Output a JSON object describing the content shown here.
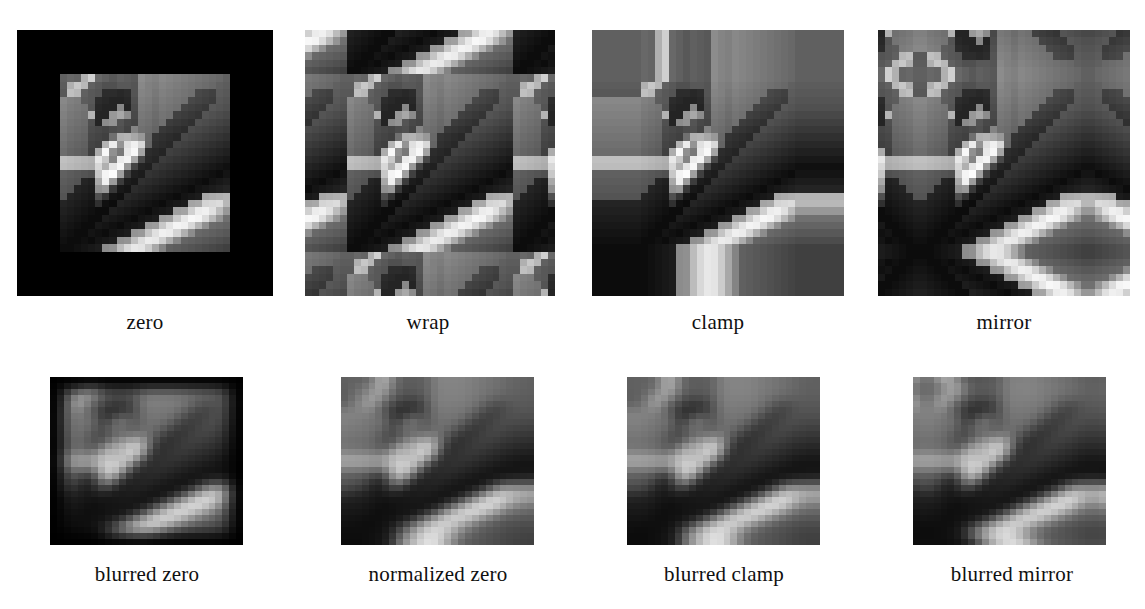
{
  "figure": {
    "name": "image-border-handling-comparison",
    "background_color": "#ffffff",
    "caption_color": "#101010",
    "rows": 2,
    "columns": 4
  },
  "panels": [
    {
      "id": "zero",
      "label": "zero",
      "mode": "zero",
      "blurred": false,
      "x": 17,
      "y": 30,
      "w": 256,
      "h": 266,
      "caption_y": 310,
      "caption_x": 17,
      "caption_w": 256,
      "border_pixels": 6,
      "border_color": "#000000"
    },
    {
      "id": "wrap",
      "label": "wrap",
      "mode": "wrap",
      "blurred": false,
      "x": 305,
      "y": 30,
      "w": 250,
      "h": 266,
      "caption_y": 310,
      "caption_x": 300,
      "caption_w": 256,
      "border_pixels": 6
    },
    {
      "id": "clamp",
      "label": "clamp",
      "mode": "clamp",
      "blurred": false,
      "x": 592,
      "y": 30,
      "w": 252,
      "h": 266,
      "caption_y": 310,
      "caption_x": 590,
      "caption_w": 256,
      "border_pixels": 6
    },
    {
      "id": "mirror",
      "label": "mirror",
      "mode": "mirror",
      "blurred": false,
      "x": 878,
      "y": 30,
      "w": 252,
      "h": 266,
      "caption_y": 310,
      "caption_x": 876,
      "caption_w": 256,
      "border_pixels": 6
    },
    {
      "id": "blurred-zero",
      "label": "blurred zero",
      "mode": "zero",
      "blurred": true,
      "x": 50,
      "y": 377,
      "w": 193,
      "h": 168,
      "caption_y": 562,
      "caption_x": 44,
      "caption_w": 206,
      "border_pixels": 2,
      "border_color": "#000000"
    },
    {
      "id": "normalized-zero",
      "label": "normalized zero",
      "mode": "normalized",
      "blurred": true,
      "x": 341,
      "y": 377,
      "w": 193,
      "h": 168,
      "caption_y": 562,
      "caption_x": 316,
      "caption_w": 244,
      "border_pixels": 2
    },
    {
      "id": "blurred-clamp",
      "label": "blurred clamp",
      "mode": "clamp",
      "blurred": true,
      "x": 627,
      "y": 377,
      "w": 193,
      "h": 168,
      "caption_y": 562,
      "caption_x": 614,
      "caption_w": 220,
      "border_pixels": 2
    },
    {
      "id": "blurred-mirror",
      "label": "blurred mirror",
      "mode": "mirror",
      "blurred": true,
      "x": 913,
      "y": 377,
      "w": 193,
      "h": 168,
      "caption_y": 562,
      "caption_x": 900,
      "caption_w": 224,
      "border_pixels": 2
    }
  ],
  "source_image": {
    "description": "low-resolution grayscale photograph of a figure in front of a building",
    "width": 24,
    "height": 24,
    "value_range": [
      0,
      255
    ],
    "pixels": [
      [
        96,
        104,
        100,
        176,
        208,
        104,
        96,
        88,
        96,
        92,
        88,
        140,
        132,
        128,
        136,
        132,
        128,
        124,
        120,
        116,
        112,
        108,
        104,
        96
      ],
      [
        92,
        176,
        200,
        184,
        96,
        88,
        80,
        80,
        88,
        88,
        84,
        136,
        128,
        124,
        132,
        128,
        124,
        120,
        116,
        112,
        108,
        104,
        96,
        92
      ],
      [
        88,
        192,
        184,
        96,
        88,
        84,
        44,
        44,
        40,
        44,
        84,
        132,
        128,
        120,
        128,
        124,
        120,
        116,
        112,
        72,
        68,
        64,
        92,
        88
      ],
      [
        136,
        128,
        124,
        92,
        88,
        44,
        40,
        36,
        36,
        40,
        80,
        128,
        124,
        116,
        124,
        120,
        116,
        112,
        72,
        68,
        64,
        60,
        88,
        84
      ],
      [
        132,
        124,
        120,
        116,
        84,
        40,
        36,
        36,
        136,
        36,
        76,
        124,
        120,
        112,
        120,
        116,
        112,
        68,
        64,
        60,
        56,
        88,
        84,
        80
      ],
      [
        128,
        120,
        116,
        112,
        180,
        36,
        36,
        152,
        168,
        140,
        72,
        120,
        116,
        108,
        116,
        112,
        64,
        60,
        56,
        52,
        84,
        80,
        76,
        72
      ],
      [
        124,
        116,
        112,
        108,
        80,
        36,
        140,
        148,
        84,
        72,
        68,
        116,
        112,
        104,
        112,
        60,
        56,
        52,
        48,
        80,
        76,
        72,
        68,
        64
      ],
      [
        120,
        112,
        108,
        104,
        76,
        72,
        68,
        76,
        80,
        68,
        132,
        112,
        108,
        100,
        56,
        52,
        48,
        44,
        76,
        72,
        68,
        64,
        60,
        56
      ],
      [
        116,
        108,
        104,
        100,
        72,
        68,
        64,
        112,
        176,
        180,
        168,
        152,
        104,
        52,
        48,
        44,
        40,
        72,
        68,
        64,
        60,
        56,
        52,
        48
      ],
      [
        112,
        104,
        100,
        96,
        68,
        64,
        180,
        236,
        148,
        224,
        240,
        216,
        100,
        48,
        44,
        40,
        68,
        64,
        60,
        56,
        52,
        48,
        44,
        40
      ],
      [
        108,
        100,
        96,
        92,
        64,
        172,
        248,
        144,
        120,
        232,
        248,
        164,
        44,
        40,
        36,
        64,
        60,
        56,
        52,
        48,
        44,
        40,
        36,
        32
      ],
      [
        192,
        188,
        184,
        180,
        176,
        232,
        200,
        132,
        236,
        244,
        168,
        72,
        40,
        36,
        60,
        56,
        52,
        48,
        44,
        40,
        36,
        32,
        28,
        24
      ],
      [
        188,
        184,
        180,
        176,
        172,
        216,
        176,
        228,
        248,
        152,
        68,
        36,
        32,
        56,
        52,
        48,
        44,
        40,
        36,
        32,
        28,
        24,
        20,
        16
      ],
      [
        96,
        92,
        88,
        84,
        80,
        200,
        244,
        252,
        160,
        64,
        32,
        28,
        52,
        48,
        44,
        40,
        36,
        32,
        28,
        24,
        20,
        16,
        12,
        20
      ],
      [
        92,
        88,
        84,
        36,
        32,
        168,
        240,
        156,
        60,
        28,
        24,
        48,
        44,
        40,
        36,
        32,
        28,
        24,
        20,
        16,
        12,
        20,
        24,
        28
      ],
      [
        88,
        84,
        36,
        32,
        28,
        144,
        152,
        56,
        24,
        20,
        44,
        40,
        36,
        32,
        28,
        24,
        20,
        16,
        12,
        20,
        24,
        28,
        32,
        36
      ],
      [
        84,
        36,
        32,
        28,
        24,
        80,
        52,
        20,
        16,
        40,
        36,
        32,
        28,
        24,
        20,
        16,
        12,
        20,
        24,
        28,
        168,
        172,
        176,
        180
      ],
      [
        36,
        32,
        28,
        24,
        20,
        48,
        16,
        12,
        36,
        32,
        28,
        24,
        20,
        16,
        12,
        20,
        24,
        28,
        164,
        168,
        212,
        216,
        220,
        184
      ],
      [
        32,
        28,
        24,
        20,
        16,
        12,
        12,
        32,
        28,
        24,
        20,
        16,
        12,
        20,
        24,
        28,
        160,
        164,
        208,
        236,
        240,
        224,
        188,
        152
      ],
      [
        28,
        24,
        20,
        16,
        12,
        12,
        28,
        24,
        20,
        16,
        12,
        20,
        24,
        28,
        156,
        160,
        204,
        232,
        248,
        244,
        220,
        184,
        148,
        112
      ],
      [
        24,
        20,
        16,
        12,
        12,
        24,
        20,
        16,
        12,
        20,
        24,
        28,
        152,
        156,
        200,
        228,
        244,
        240,
        216,
        180,
        144,
        108,
        104,
        100
      ],
      [
        20,
        16,
        12,
        12,
        20,
        16,
        12,
        20,
        24,
        28,
        148,
        152,
        196,
        224,
        240,
        236,
        212,
        176,
        140,
        104,
        100,
        96,
        92,
        88
      ],
      [
        16,
        12,
        12,
        16,
        12,
        20,
        24,
        28,
        144,
        148,
        192,
        220,
        236,
        232,
        208,
        172,
        136,
        100,
        96,
        92,
        88,
        84,
        80,
        76
      ],
      [
        12,
        12,
        16,
        20,
        24,
        28,
        140,
        144,
        188,
        216,
        232,
        228,
        204,
        168,
        132,
        96,
        92,
        88,
        84,
        80,
        76,
        72,
        68,
        64
      ]
    ]
  }
}
